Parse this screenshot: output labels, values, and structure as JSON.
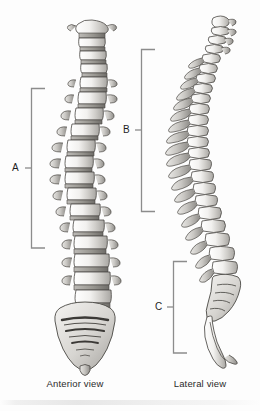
{
  "figure": {
    "background_color": "#fdfdfd",
    "ink_color": "#2b2b2b",
    "bracket_color": "#8c8c8c"
  },
  "views": [
    {
      "id": "anterior",
      "caption": "Anterior view",
      "icon_name": "spine-anterior-illustration"
    },
    {
      "id": "lateral",
      "caption": "Lateral view",
      "icon_name": "spine-lateral-illustration"
    }
  ],
  "brackets": [
    {
      "id": "a",
      "label": "A",
      "view": "anterior",
      "region": "thoracic"
    },
    {
      "id": "b",
      "label": "B",
      "view": "lateral",
      "region": "thoracic"
    },
    {
      "id": "c",
      "label": "C",
      "view": "lateral",
      "region": "sacral"
    }
  ]
}
